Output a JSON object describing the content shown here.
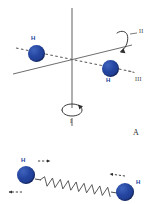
{
  "figure": {
    "background_color": "#ffffff",
    "atom_color": "#20409A",
    "line_color": "#555555"
  },
  "panels": [
    {
      "id": "panel-a",
      "label": "A",
      "description": "Rotational axes of a diatomic hydrogen molecule",
      "atoms": [
        {
          "label": "H",
          "cx": 36,
          "cy": 53,
          "r": 8.5,
          "label_x": 31,
          "label_y": 39
        },
        {
          "label": "H",
          "cx": 110,
          "cy": 68,
          "r": 8.5,
          "label_x": 106,
          "label_y": 80
        }
      ],
      "axes": [
        {
          "name": "I",
          "label": "I",
          "label_x": 71,
          "label_y": 120,
          "kind": "vertical"
        },
        {
          "name": "II",
          "label": "II",
          "label_x": 140,
          "label_y": 31,
          "kind": "oblique-in-plane"
        },
        {
          "name": "III",
          "label": "III",
          "label_x": 136,
          "label_y": 79,
          "kind": "bond-axis"
        }
      ],
      "rotation_arrows": [
        {
          "axis": "I",
          "cx": 72,
          "cy": 113
        },
        {
          "axis": "II",
          "cx": 123,
          "cy": 42
        }
      ]
    },
    {
      "id": "panel-b",
      "description": "Vibrational stretching mode represented by a spring",
      "atoms": [
        {
          "label": "H",
          "cx": 26,
          "cy": 175,
          "r": 9,
          "label_x": 21,
          "label_y": 161
        },
        {
          "label": "H",
          "cx": 125,
          "cy": 192,
          "r": 9,
          "label_x": 136,
          "label_y": 182
        }
      ],
      "spring": {
        "x1": 40,
        "y1": 180,
        "x2": 112,
        "y2": 192,
        "coils": 17
      },
      "motion_arrows": [
        {
          "at": "left-upper",
          "direction": "right"
        },
        {
          "at": "left-lower",
          "direction": "left"
        },
        {
          "at": "right-upper",
          "direction": "left"
        }
      ]
    }
  ]
}
